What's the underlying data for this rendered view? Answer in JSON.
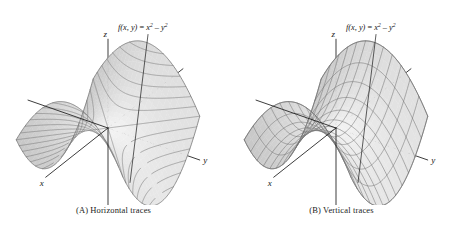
{
  "figure": {
    "background_color": "#ffffff",
    "surface_fill": "#e8e8e8",
    "surface_stroke": "#8a8a8a",
    "axis_color": "#1a1a1a"
  },
  "panels": [
    {
      "id": "A",
      "caption_tag": "(A)",
      "caption_text": "Horizontal traces",
      "trace_mode": "horizontal",
      "function_label": {
        "lhs": "f(x, y)",
        "equals": " = ",
        "term1_base": "x",
        "term1_exp": "2",
        "minus": " – ",
        "term2_base": "y",
        "term2_exp": "2"
      },
      "axes": [
        {
          "name": "z",
          "label": "z"
        },
        {
          "name": "x",
          "label": "x"
        },
        {
          "name": "y",
          "label": "y"
        }
      ]
    },
    {
      "id": "B",
      "caption_tag": "(B)",
      "caption_text": "Vertical traces",
      "trace_mode": "vertical",
      "function_label": {
        "lhs": "f(x, y)",
        "equals": " = ",
        "term1_base": "x",
        "term1_exp": "2",
        "minus": " – ",
        "term2_base": "y",
        "term2_exp": "2"
      },
      "axes": [
        {
          "name": "z",
          "label": "z"
        },
        {
          "name": "x",
          "label": "x"
        },
        {
          "name": "y",
          "label": "y"
        }
      ]
    }
  ],
  "chart_data": {
    "type": "surface",
    "title": "",
    "function": "f(x, y) = x^2 - y^2",
    "surface_name": "hyperbolic paraboloid (saddle)",
    "xlabel": "x",
    "ylabel": "y",
    "zlabel": "z",
    "xlim": [
      -1,
      1
    ],
    "ylim": [
      -1,
      1
    ],
    "zlim": [
      -1,
      1
    ],
    "grid": false,
    "legend": "none",
    "mesh_u_count": 13,
    "mesh_v_count": 13,
    "horizontal_trace_levels": [
      -0.9,
      -0.75,
      -0.6,
      -0.45,
      -0.3,
      -0.15,
      0,
      0.15,
      0.3,
      0.45,
      0.6,
      0.75,
      0.9
    ],
    "projection": {
      "type": "axonometric",
      "x_axis_screen_dir": [
        -0.62,
        0.49
      ],
      "y_axis_screen_dir": [
        0.86,
        0.3
      ],
      "z_axis_screen_dir": [
        0,
        -1
      ]
    },
    "annotations": [
      {
        "text": "f(x, y) = x^2 - y^2",
        "attached_to": "surface-upper-right",
        "leader_line": true
      }
    ]
  }
}
